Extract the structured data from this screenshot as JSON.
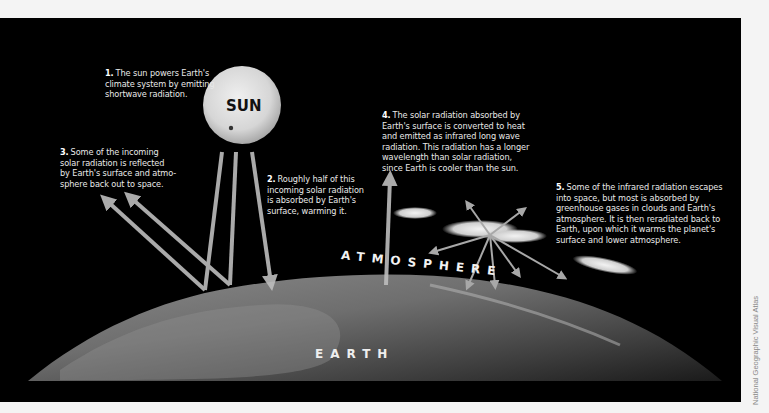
{
  "figure": {
    "colors": {
      "background": "#000000",
      "page": "#f4f4f4",
      "arrow": "#bdbdbd",
      "text": "#e8e8e8",
      "sun": "#d9d9d9"
    },
    "sun": {
      "label": "SUN",
      "icon": "sun-icon"
    },
    "earth": {
      "label": "EARTH"
    },
    "atmosphere": {
      "label": "ATMOSPHERE"
    },
    "captions": [
      {
        "number": "1.",
        "text": "The sun powers Earth's climate system by emitting shortwave radiation.",
        "lines": [
          "The sun powers Earth's",
          "climate system by emitting",
          "shortwave radiation."
        ]
      },
      {
        "number": "2.",
        "text": "Roughly half of this incoming solar radiation is absorbed by Earth's surface, warming it.",
        "lines": [
          "Roughly half of this",
          "incoming solar radiation",
          "is absorbed by Earth's",
          "surface, warming it."
        ]
      },
      {
        "number": "3.",
        "text": "Some of the incoming solar radiation is reflected by Earth's surface and atmosphere back out to space.",
        "lines": [
          "Some of the incoming",
          "solar radiation is reflected",
          "by Earth's surface and atmo-",
          "sphere back out to space."
        ]
      },
      {
        "number": "4.",
        "text": "The solar radiation absorbed by Earth's surface is converted to heat and emitted as infrared long wave radiation. This radiation has a longer wavelength than solar radiation, since Earth is cooler than the sun.",
        "lines": [
          "The solar radiation absorbed by",
          "Earth's surface is converted to heat",
          "and emitted as infrared long wave",
          "radiation. This radiation has a longer",
          "wavelength than solar radiation,",
          "since Earth is cooler than the sun."
        ]
      },
      {
        "number": "5.",
        "text": "Some of the infrared radiation escapes into space, but most is absorbed by greenhouse gases in clouds and Earth's atmosphere. It is then reradiated back to Earth, upon which it warms the planet's surface and lower atmosphere.",
        "lines": [
          "Some of the infrared radiation escapes",
          "into space, but most is absorbed by",
          "greenhouse gases in clouds and Earth's",
          "atmosphere. It is then reradiated back to",
          "Earth, upon which it warms the planet's",
          "surface and lower atmosphere."
        ]
      }
    ],
    "credit": "National Geographic Visual Atlas"
  }
}
